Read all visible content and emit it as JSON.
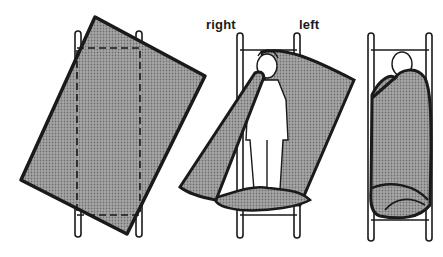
{
  "figure": {
    "colors": {
      "ink": "#1a1a1a",
      "blanket": "#8c8c8c",
      "background": "#ffffff"
    },
    "panels": [
      {
        "id": "step-1",
        "caption": "",
        "content": "blanket laid diagonally over stretcher; dashed outline shows stretcher position beneath"
      },
      {
        "id": "step-2",
        "caption": "",
        "content": "person lying on stretcher; blanket corners folded over",
        "labels": {
          "right": "right",
          "left": "left"
        }
      },
      {
        "id": "step-3",
        "caption": "",
        "content": "person fully wrapped in blanket on stretcher"
      }
    ]
  }
}
